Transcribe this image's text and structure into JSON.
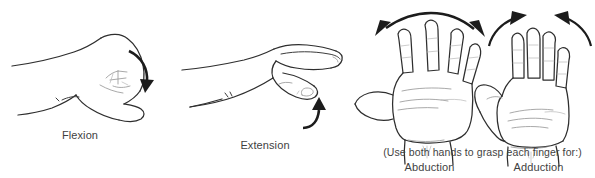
{
  "diagram": {
    "background_color": "#ffffff",
    "line_color": "#2e2e2e",
    "crease_color": "#9a9a9a",
    "arrow_color": "#1c1c1c",
    "text_color": "#3f3f3f"
  },
  "panels": [
    {
      "id": "flexion",
      "label": "Flexion",
      "view": "lateral-closed-fist",
      "arrow": {
        "name": "curved-arrow-down",
        "direction": "clockwise-downward",
        "position": "right-of-fist"
      }
    },
    {
      "id": "extension",
      "label": "Extension",
      "view": "lateral-extended-fingers",
      "arrow": {
        "name": "curved-arrow-up",
        "direction": "counterclockwise-upward",
        "position": "below-fingers"
      }
    },
    {
      "id": "abduction",
      "label": "Abduction",
      "view": "palmar-fingers-spread",
      "arrow": {
        "name": "double-arrow-outward",
        "direction": "outward-both-sides",
        "position": "above-fingertips"
      }
    },
    {
      "id": "adduction",
      "label": "Adduction",
      "view": "palmar-fingers-together",
      "arrow": {
        "name": "double-arrow-inward",
        "direction": "inward-both-sides",
        "position": "above-fingertips"
      }
    }
  ],
  "notes": {
    "grasp_instruction": "(Use both hands to grasp each finger for:)"
  }
}
